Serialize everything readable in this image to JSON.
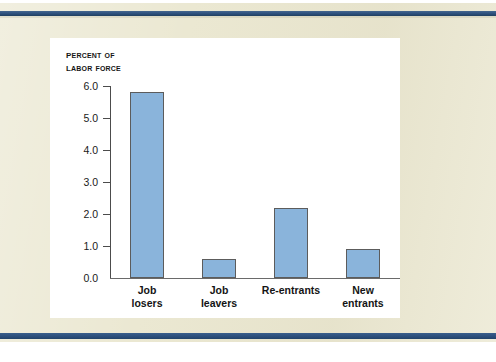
{
  "page": {
    "background_color": "#ebe8d2",
    "rule_color": "#2f5481",
    "panel_color": "#ffffff"
  },
  "chart_data": {
    "type": "bar",
    "title": "",
    "subtitle": "",
    "axis_title_line1": "Percent of",
    "axis_title_line2": "Labor force",
    "xlabel": "",
    "ylabel": "Percent of Labor Force",
    "categories": [
      "Job losers",
      "Job leavers",
      "Re-entrants",
      "New entrants"
    ],
    "category_lines": [
      [
        "Job",
        "losers"
      ],
      [
        "Job",
        "leavers"
      ],
      [
        "Re-entrants",
        ""
      ],
      [
        "New",
        "entrants"
      ]
    ],
    "values": [
      5.8,
      0.6,
      2.2,
      0.9
    ],
    "ylim": [
      0.0,
      6.0
    ],
    "ytick_labels": [
      "6.0",
      "5.0",
      "4.0",
      "3.0",
      "2.0",
      "1.0",
      "0.0"
    ],
    "ytick_values": [
      6.0,
      5.0,
      4.0,
      3.0,
      2.0,
      1.0,
      0.0
    ],
    "grid": false,
    "legend": null,
    "bar_color": "#8ab4db",
    "bar_border_color": "#5c5c5c",
    "axis_color": "#4c4c4c"
  }
}
